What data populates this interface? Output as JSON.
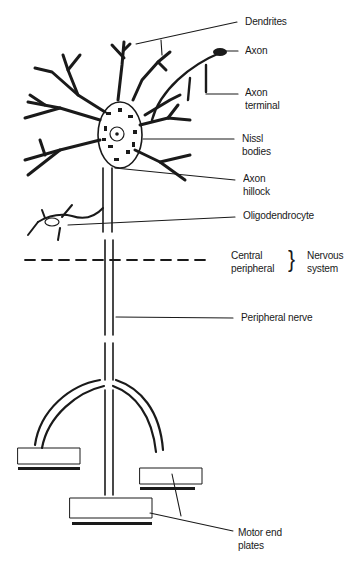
{
  "figure": {
    "ink_color": "#1a1a1a",
    "background": "#ffffff"
  },
  "labels": {
    "dendrites": "Dendrites",
    "axon": "Axon",
    "axon_terminal_1": "Axon",
    "axon_terminal_2": "terminal",
    "nissl_1": "Nissl",
    "nissl_2": "bodies",
    "axon_hillock_1": "Axon",
    "axon_hillock_2": "hillock",
    "oligodendrocyte": "Oligodendrocyte",
    "central": "Central",
    "peripheral": "peripheral",
    "brace": "}",
    "nervous_1": "Nervous",
    "nervous_2": "system",
    "peripheral_nerve": "Peripheral nerve",
    "motor_1": "Motor end",
    "motor_2": "plates"
  }
}
